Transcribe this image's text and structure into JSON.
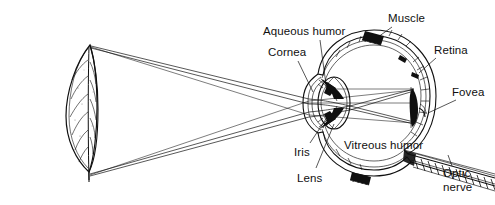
{
  "figure": {
    "type": "anatomical-diagram",
    "background_color": "#ffffff",
    "ink_color": "#101010",
    "width": 495,
    "height": 205
  },
  "labels": {
    "aqueous_humor": "Aqueous humor",
    "cornea": "Cornea",
    "muscle": "Muscle",
    "retina": "Retina",
    "fovea": "Fovea",
    "vitreous_humor": "Vitreous humor",
    "iris": "Iris",
    "lens": "Lens",
    "optic_nerve_line1": "Optic",
    "optic_nerve_line2": "nerve"
  },
  "parts": [
    {
      "key": "aqueous_humor",
      "label": "Aqueous humor",
      "label_x": 263,
      "label_y": 25
    },
    {
      "key": "cornea",
      "label": "Cornea",
      "label_x": 268,
      "label_y": 46
    },
    {
      "key": "muscle",
      "label": "Muscle",
      "label_x": 388,
      "label_y": 12
    },
    {
      "key": "retina",
      "label": "Retina",
      "label_x": 434,
      "label_y": 44
    },
    {
      "key": "fovea",
      "label": "Fovea",
      "label_x": 452,
      "label_y": 86
    },
    {
      "key": "vitreous_humor",
      "label": "Vitreous humor",
      "label_x": 344,
      "label_y": 139
    },
    {
      "key": "iris",
      "label": "Iris",
      "label_x": 294,
      "label_y": 146
    },
    {
      "key": "lens",
      "label": "Lens",
      "label_x": 297,
      "label_y": 172
    },
    {
      "key": "optic_nerve",
      "label": "Optic nerve",
      "label_x": 443,
      "label_y": 170
    }
  ],
  "object": {
    "name": "leaf",
    "description": "Upright leaf-shaped object at left serving as the viewed object",
    "x": 55,
    "y": 40,
    "width": 45,
    "height": 135
  },
  "optics": {
    "description": "Light rays from the tip and base of the leaf converge through the cornea and lens, cross, and form an inverted image on the retina at the fovea",
    "ray_bundles": 2,
    "image_orientation": "inverted"
  }
}
